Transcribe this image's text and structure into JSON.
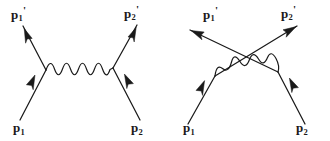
{
  "figure": {
    "kind": "feynman-diagrams",
    "background_color": "#ffffff",
    "line_color": "#1a1a1a",
    "text_color": "#1a1a1a",
    "diagrams": [
      {
        "id": "t-channel",
        "name": "t-channel-scattering-diagram",
        "labels": {
          "out_left": {
            "base": "p",
            "sub": "1",
            "prime": "'"
          },
          "out_right": {
            "base": "p",
            "sub": "2",
            "prime": "'"
          },
          "in_left": {
            "base": "p",
            "sub": "1",
            "prime": ""
          },
          "in_right": {
            "base": "p",
            "sub": "2",
            "prime": ""
          }
        }
      },
      {
        "id": "u-channel",
        "name": "u-channel-crossed-scattering-diagram",
        "labels": {
          "out_left": {
            "base": "p",
            "sub": "1",
            "prime": "'"
          },
          "out_right": {
            "base": "p",
            "sub": "2",
            "prime": "'"
          },
          "in_left": {
            "base": "p",
            "sub": "1",
            "prime": ""
          },
          "in_right": {
            "base": "p",
            "sub": "2",
            "prime": ""
          }
        }
      }
    ]
  }
}
